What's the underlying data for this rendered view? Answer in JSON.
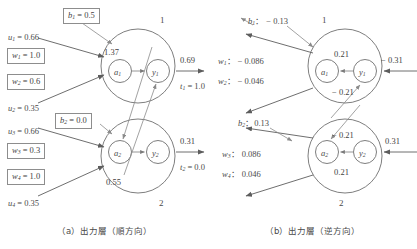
{
  "figure": {
    "panels": [
      {
        "id": "a",
        "caption": "（a）出力層（順方向）",
        "neurons": [
          {
            "index": "1",
            "a_label": "a",
            "a_sub": "1",
            "y_label": "y",
            "y_sub": "1",
            "pre_activation": "1.37",
            "output": "0.69",
            "target_label": "t",
            "target_sub": "1",
            "target_value": "= 1.0",
            "bias_label": "b",
            "bias_sub": "1",
            "bias_value": "= 0.5",
            "inputs": [
              {
                "label": "u",
                "sub": "1",
                "value": "= 0.66"
              },
              {
                "label": "u",
                "sub": "2",
                "value": "= 0.35"
              }
            ],
            "weights": [
              {
                "label": "w",
                "sub": "1",
                "value": "= 1.0"
              },
              {
                "label": "w",
                "sub": "2",
                "value": "= 0.6"
              }
            ]
          },
          {
            "index": "2",
            "a_label": "a",
            "a_sub": "2",
            "y_label": "y",
            "y_sub": "2",
            "pre_activation": "0.55",
            "output": "0.31",
            "target_label": "t",
            "target_sub": "2",
            "target_value": "= 0.0",
            "bias_label": "b",
            "bias_sub": "2",
            "bias_value": "= 0.0",
            "inputs": [
              {
                "label": "u",
                "sub": "3",
                "value": "= 0.66"
              },
              {
                "label": "u",
                "sub": "4",
                "value": "= 0.35"
              }
            ],
            "weights": [
              {
                "label": "w",
                "sub": "3",
                "value": "= 0.3"
              },
              {
                "label": "w",
                "sub": "4",
                "value": "= 1.0"
              }
            ]
          }
        ]
      },
      {
        "id": "b",
        "caption": "（b）出力層（逆方向）",
        "neurons": [
          {
            "index": "1",
            "a_label": "a",
            "a_sub": "1",
            "y_label": "y",
            "y_sub": "1",
            "grad_in": "− 0.31",
            "grad_upper": "0.21",
            "grad_lower": "− 0.21",
            "bias_label": "b",
            "bias_sub": "1",
            "bias_value": "： − 0.13",
            "weights": [
              {
                "label": "w",
                "sub": "1",
                "value": "： − 0.086"
              },
              {
                "label": "w",
                "sub": "2",
                "value": "： − 0.046"
              }
            ]
          },
          {
            "index": "2",
            "a_label": "a",
            "a_sub": "2",
            "y_label": "y",
            "y_sub": "2",
            "grad_in": "0.31",
            "grad_upper": "− 0.21",
            "grad_lower": "0.21",
            "bias_label": "b",
            "bias_sub": "2",
            "bias_value": "：0.13",
            "weights": [
              {
                "label": "w",
                "sub": "3",
                "value": "： 0.086"
              },
              {
                "label": "w",
                "sub": "4",
                "value": "： 0.046"
              }
            ]
          }
        ]
      }
    ],
    "colors": {
      "stroke": "#6f6f6f",
      "text": "#3f3f3f",
      "box_border": "#8d8d8d"
    }
  }
}
